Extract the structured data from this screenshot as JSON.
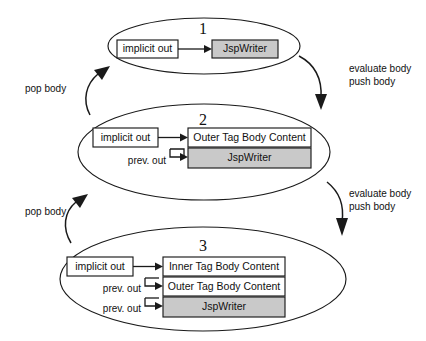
{
  "diagram": {
    "colors": {
      "shaded_fill": "#c9c9c9",
      "box_fill": "#ffffff",
      "stroke": "#1a1a1a",
      "background": "#ffffff"
    },
    "panels": [
      {
        "number": "1",
        "boxes": [
          {
            "label": "implicit out",
            "shaded": false
          },
          {
            "label": "JspWriter",
            "shaded": true
          }
        ],
        "edge_labels": []
      },
      {
        "number": "2",
        "boxes": [
          {
            "label": "implicit out",
            "shaded": false
          },
          {
            "label": "Outer Tag Body Content",
            "shaded": false
          },
          {
            "label": "JspWriter",
            "shaded": true
          }
        ],
        "edge_labels": [
          "prev. out"
        ]
      },
      {
        "number": "3",
        "boxes": [
          {
            "label": "implicit out",
            "shaded": false
          },
          {
            "label": "Inner Tag Body Content",
            "shaded": false
          },
          {
            "label": "Outer Tag Body Content",
            "shaded": false
          },
          {
            "label": "JspWriter",
            "shaded": true
          }
        ],
        "edge_labels": [
          "prev. out",
          "prev. out"
        ]
      }
    ],
    "transitions": {
      "down_1_to_2": {
        "line1": "evaluate body",
        "line2": "push body"
      },
      "down_2_to_3": {
        "line1": "evaluate body",
        "line2": "push body"
      },
      "up_2_to_1": {
        "label": "pop body"
      },
      "up_3_to_2": {
        "label": "pop body"
      }
    }
  }
}
